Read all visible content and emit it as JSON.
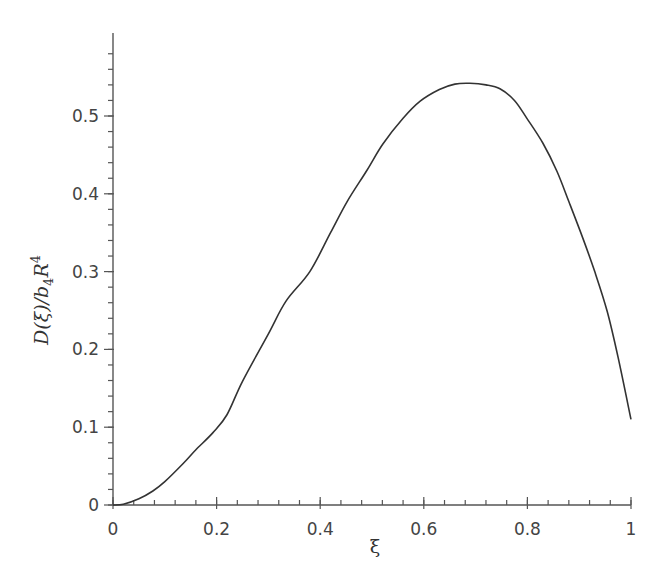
{
  "chart_data": {
    "type": "line",
    "title": "",
    "xlabel": "ξ",
    "ylabel": "D(ξ)/b4R4",
    "ylabel_parts": {
      "main": "D(ξ)/b",
      "sub": "4",
      "mid": "R",
      "sup": "4"
    },
    "xlim": [
      0,
      1
    ],
    "ylim": [
      0,
      0.6
    ],
    "grid": false,
    "legend": null,
    "x_ticks": [
      0,
      0.2,
      0.4,
      0.6,
      0.8,
      1
    ],
    "x_tick_labels": [
      "0",
      "0.2",
      "0.4",
      "0.6",
      "0.8",
      "1"
    ],
    "y_ticks": [
      0,
      0.1,
      0.2,
      0.3,
      0.4,
      0.5
    ],
    "y_tick_labels": [
      "0",
      "0.1",
      "0.2",
      "0.3",
      "0.4",
      "0.5"
    ],
    "series": [
      {
        "name": "D(ξ)/b4R4",
        "color": "#333333",
        "x": [
          0,
          0.02,
          0.05,
          0.077,
          0.1,
          0.135,
          0.16,
          0.193,
          0.22,
          0.25,
          0.3,
          0.334,
          0.38,
          0.42,
          0.452,
          0.49,
          0.521,
          0.56,
          0.593,
          0.63,
          0.66,
          0.689,
          0.72,
          0.747,
          0.775,
          0.799,
          0.83,
          0.857,
          0.88,
          0.907,
          0.93,
          0.954,
          0.975,
          1.0
        ],
        "y": [
          0,
          0.001,
          0.008,
          0.018,
          0.03,
          0.053,
          0.071,
          0.093,
          0.116,
          0.159,
          0.22,
          0.262,
          0.3,
          0.35,
          0.39,
          0.43,
          0.464,
          0.497,
          0.519,
          0.534,
          0.541,
          0.542,
          0.54,
          0.535,
          0.52,
          0.497,
          0.465,
          0.429,
          0.39,
          0.343,
          0.3,
          0.249,
          0.19,
          0.11
        ]
      }
    ]
  },
  "axes": {
    "x_label": "ξ",
    "y_label_main": "D(ξ)/b",
    "y_label_sub": "4",
    "y_label_R": "R",
    "y_label_sup": "4"
  }
}
